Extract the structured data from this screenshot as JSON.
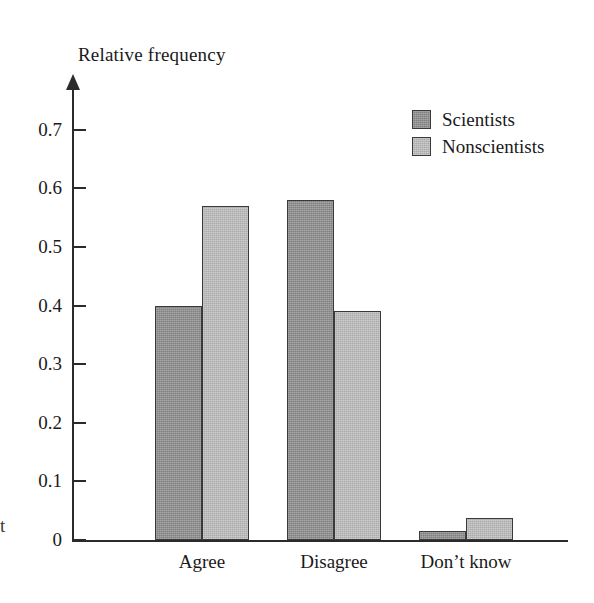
{
  "figure": {
    "axis_caption": "Relative frequency",
    "edge_fragment": "t"
  },
  "legend": {
    "position": "top-right",
    "entries": [
      {
        "label": "Scientists",
        "color": "#8d8d8d"
      },
      {
        "label": "Nonscientists",
        "color": "#bcbcbc"
      }
    ]
  },
  "axes": {
    "y_ticks": [
      "0.7",
      "0.6",
      "0.5",
      "0.4",
      "0.3",
      "0.2",
      "0.1",
      "0"
    ],
    "x_categories": [
      "Agree",
      "Disagree",
      "Don’t know"
    ]
  },
  "chart_data": {
    "type": "bar",
    "title": "",
    "xlabel": "",
    "ylabel": "Relative frequency",
    "categories": [
      "Agree",
      "Disagree",
      "Don’t know"
    ],
    "series": [
      {
        "name": "Scientists",
        "color": "#8d8d8d",
        "values": [
          0.4,
          0.58,
          0.015
        ]
      },
      {
        "name": "Nonscientists",
        "color": "#bcbcbc",
        "values": [
          0.57,
          0.39,
          0.037
        ]
      }
    ],
    "ylim": [
      0,
      0.75
    ],
    "ytick_values": [
      0,
      0.1,
      0.2,
      0.3,
      0.4,
      0.5,
      0.6,
      0.7
    ],
    "ytick_labels": [
      "0",
      "0.1",
      "0.2",
      "0.3",
      "0.4",
      "0.5",
      "0.6",
      "0.7"
    ],
    "grid": false,
    "legend_position": "top-right",
    "grouped": true
  }
}
